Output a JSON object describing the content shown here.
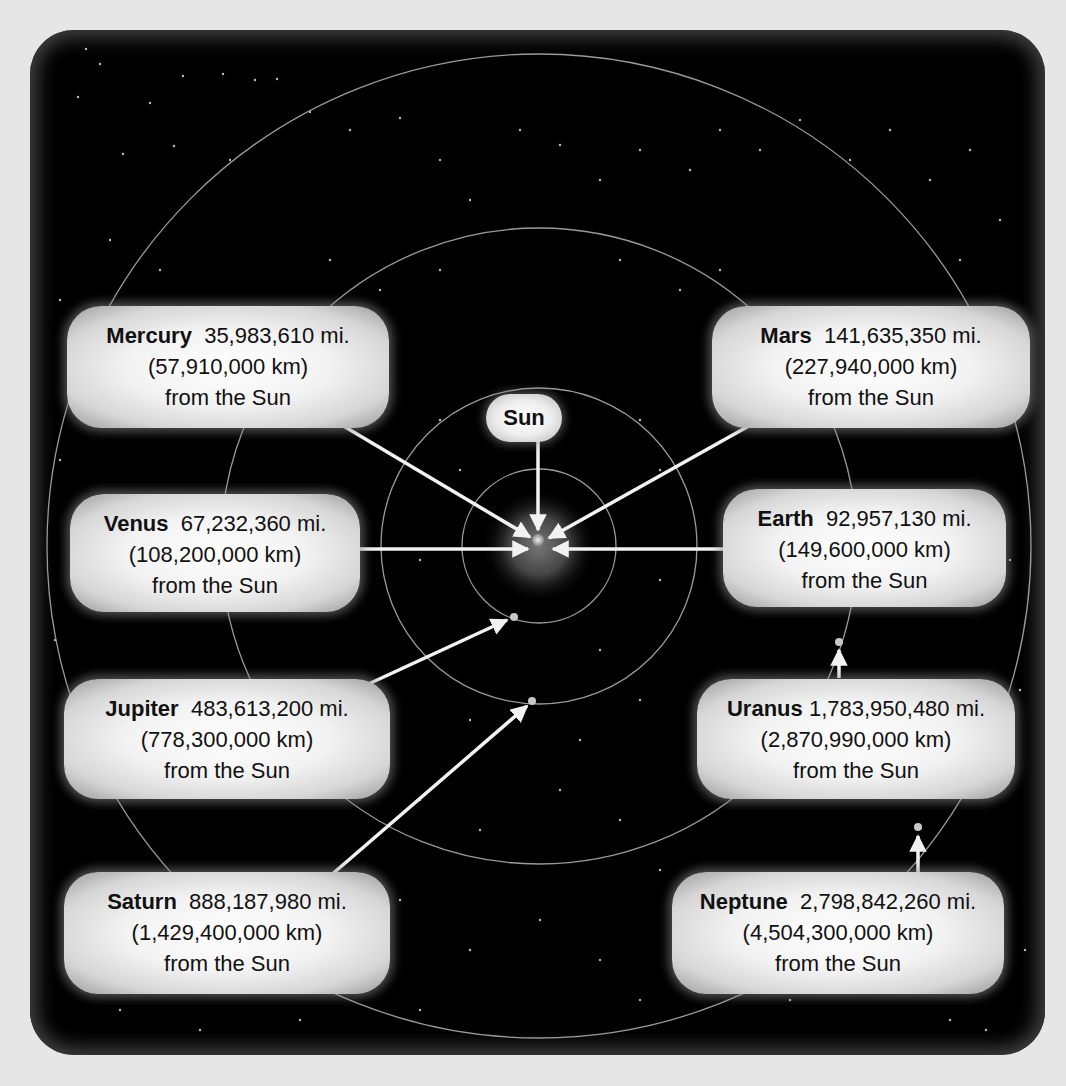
{
  "diagram": {
    "center_label": "Sun",
    "colors": {
      "page_background": "#e6e6e6",
      "space_background": "#000000",
      "label_background": "#f0f0f0",
      "text": "#111111",
      "orbit_line": "#9a9a9a",
      "arrow": "#f2f2f2"
    },
    "planets": [
      {
        "name": "Mercury",
        "miles": "35,983,610 mi.",
        "km": "(57,910,000 km)",
        "suffix": "from the Sun"
      },
      {
        "name": "Venus",
        "miles": "67,232,360 mi.",
        "km": "(108,200,000 km)",
        "suffix": "from the Sun"
      },
      {
        "name": "Earth",
        "miles": "92,957,130 mi.",
        "km": "(149,600,000 km)",
        "suffix": "from the Sun"
      },
      {
        "name": "Mars",
        "miles": "141,635,350 mi.",
        "km": "(227,940,000 km)",
        "suffix": "from the Sun"
      },
      {
        "name": "Jupiter",
        "miles": "483,613,200 mi.",
        "km": "(778,300,000 km)",
        "suffix": "from the Sun"
      },
      {
        "name": "Saturn",
        "miles": "888,187,980 mi.",
        "km": "(1,429,400,000 km)",
        "suffix": "from the Sun"
      },
      {
        "name": "Uranus",
        "miles": "1,783,950,480 mi.",
        "km": "(2,870,990,000 km)",
        "suffix": "from the Sun"
      },
      {
        "name": "Neptune",
        "miles": "2,798,842,260 mi.",
        "km": "(4,504,300,000 km)",
        "suffix": "from the Sun"
      }
    ]
  }
}
